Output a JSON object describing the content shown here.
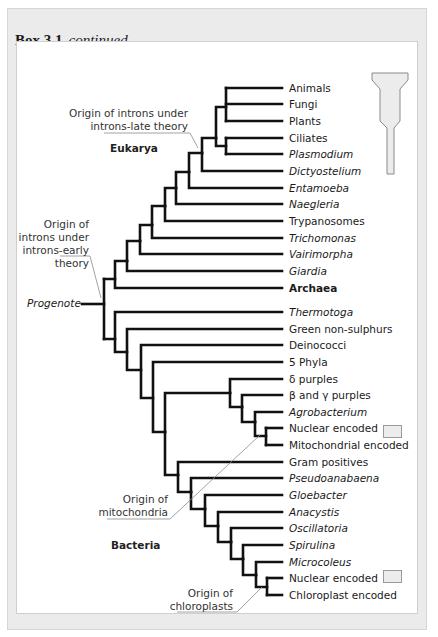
{
  "header": {
    "box_label": "Box 3.1",
    "box_status": "continued"
  },
  "groups": {
    "eukarya": "Eukarya",
    "bacteria": "Bacteria",
    "root": "Progenote"
  },
  "annotations": {
    "introns_late": [
      "Origin of introns under",
      "introns-late theory"
    ],
    "introns_early": [
      "Origin of",
      "introns under",
      "introns-early",
      "theory"
    ],
    "mitochondria": [
      "Origin of",
      "mitochondria"
    ],
    "chloroplasts": [
      "Origin of",
      "chloroplasts"
    ]
  },
  "leaves": [
    {
      "label": "Animals",
      "style": "normal"
    },
    {
      "label": "Fungi",
      "style": "normal"
    },
    {
      "label": "Plants",
      "style": "normal"
    },
    {
      "label": "Ciliates",
      "style": "normal"
    },
    {
      "label": "Plasmodium",
      "style": "italic"
    },
    {
      "label": "Dictyostelium",
      "style": "italic"
    },
    {
      "label": "Entamoeba",
      "style": "italic"
    },
    {
      "label": "Naegleria",
      "style": "italic"
    },
    {
      "label": "Trypanosomes",
      "style": "normal"
    },
    {
      "label": "Trichomonas",
      "style": "italic"
    },
    {
      "label": "Vairimorpha",
      "style": "italic"
    },
    {
      "label": "Giardia",
      "style": "italic"
    },
    {
      "label": "Archaea",
      "style": "bold"
    },
    {
      "label": "Thermotoga",
      "style": "italic"
    },
    {
      "label": "Green non-sulphurs",
      "style": "normal"
    },
    {
      "label": "Deinococci",
      "style": "normal"
    },
    {
      "label": "5 Phyla",
      "style": "normal"
    },
    {
      "label": "δ purples",
      "style": "normal"
    },
    {
      "label": "β and γ purples",
      "style": "normal"
    },
    {
      "label": "Agrobacterium",
      "style": "italic"
    },
    {
      "label": "Nuclear encoded",
      "style": "normal"
    },
    {
      "label": "Mitochondrial encoded",
      "style": "normal"
    },
    {
      "label": "Gram positives",
      "style": "normal"
    },
    {
      "label": "Pseudoanabaena",
      "style": "italic"
    },
    {
      "label": "Gloebacter",
      "style": "italic"
    },
    {
      "label": "Anacystis",
      "style": "italic"
    },
    {
      "label": "Oscillatoria",
      "style": "italic"
    },
    {
      "label": "Spirulina",
      "style": "italic"
    },
    {
      "label": "Microcoleus",
      "style": "italic"
    },
    {
      "label": "Nuclear encoded",
      "style": "normal"
    },
    {
      "label": "Chloroplast encoded",
      "style": "normal"
    }
  ],
  "legend_icon": "funnel-scale-icon",
  "colors": {
    "branch": "#111111",
    "pointer": "#8a8a8a",
    "swatch": "#ececec"
  }
}
